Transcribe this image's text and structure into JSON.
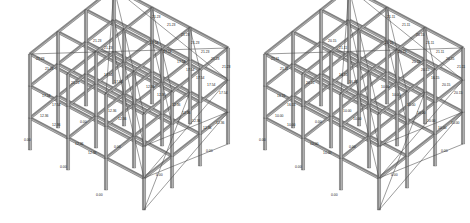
{
  "figure": {
    "type": "structural-frame-elevation-diagram",
    "background_color": "#ffffff",
    "member_color": "#8a8a8a",
    "member_edge_color": "#3a3a3a",
    "brace_color": "#4a4a4a",
    "label_color": "#1a1a1a",
    "panel_count": 2
  },
  "panels": [
    {
      "id": "left-frame",
      "name": "left-structural-frame",
      "storeys": 3,
      "bays_x": 3,
      "bays_y": 3,
      "level_values": [
        "0.00",
        "12.36",
        "17.54",
        "21.23"
      ],
      "labels": [
        {
          "text": "21.23",
          "x": 152,
          "y": 18
        },
        {
          "text": "21.23",
          "x": 167,
          "y": 26
        },
        {
          "text": "21.23",
          "x": 181,
          "y": 36
        },
        {
          "text": "21.23",
          "x": 191,
          "y": 44
        },
        {
          "text": "21.23",
          "x": 201,
          "y": 53
        },
        {
          "text": "21.23",
          "x": 211,
          "y": 60
        },
        {
          "text": "21.23",
          "x": 222,
          "y": 68
        },
        {
          "text": "21.23",
          "x": 93,
          "y": 42
        },
        {
          "text": "21.23",
          "x": 104,
          "y": 49
        },
        {
          "text": "21.23",
          "x": 36,
          "y": 60
        },
        {
          "text": "21.23",
          "x": 45,
          "y": 70
        },
        {
          "text": "21.23",
          "x": 71,
          "y": 84
        },
        {
          "text": "17.54",
          "x": 150,
          "y": 44
        },
        {
          "text": "17.54",
          "x": 163,
          "y": 53
        },
        {
          "text": "17.54",
          "x": 177,
          "y": 63
        },
        {
          "text": "17.54",
          "x": 186,
          "y": 71
        },
        {
          "text": "17.54",
          "x": 196,
          "y": 79
        },
        {
          "text": "17.54",
          "x": 207,
          "y": 86
        },
        {
          "text": "17.54",
          "x": 219,
          "y": 94
        },
        {
          "text": "17.54",
          "x": 104,
          "y": 76
        },
        {
          "text": "17.54",
          "x": 114,
          "y": 83
        },
        {
          "text": "17.54",
          "x": 42,
          "y": 97
        },
        {
          "text": "17.54",
          "x": 52,
          "y": 106
        },
        {
          "text": "12.36",
          "x": 146,
          "y": 88
        },
        {
          "text": "12.36",
          "x": 157,
          "y": 96
        },
        {
          "text": "12.36",
          "x": 172,
          "y": 106
        },
        {
          "text": "12.36",
          "x": 182,
          "y": 114
        },
        {
          "text": "12.36",
          "x": 192,
          "y": 122
        },
        {
          "text": "12.36",
          "x": 203,
          "y": 129
        },
        {
          "text": "12.36",
          "x": 216,
          "y": 124
        },
        {
          "text": "12.36",
          "x": 108,
          "y": 112
        },
        {
          "text": "12.36",
          "x": 118,
          "y": 120
        },
        {
          "text": "12.36",
          "x": 40,
          "y": 117
        },
        {
          "text": "12.36",
          "x": 52,
          "y": 126
        },
        {
          "text": "12.36",
          "x": 75,
          "y": 145
        },
        {
          "text": "12.36",
          "x": 88,
          "y": 154
        },
        {
          "text": "0.00",
          "x": 24,
          "y": 141
        },
        {
          "text": "0.00",
          "x": 60,
          "y": 168
        },
        {
          "text": "0.00",
          "x": 96,
          "y": 196
        },
        {
          "text": "0.00",
          "x": 114,
          "y": 148
        },
        {
          "text": "0.00",
          "x": 156,
          "y": 176
        },
        {
          "text": "0.00",
          "x": 206,
          "y": 152
        },
        {
          "text": "0.00",
          "x": 80,
          "y": 123
        }
      ]
    },
    {
      "id": "right-frame",
      "name": "right-structural-frame",
      "storeys": 3,
      "bays_x": 3,
      "bays_y": 3,
      "level_values": [
        "0.00",
        "10.00",
        "16.15",
        "20.15",
        "21.11"
      ],
      "labels": [
        {
          "text": "21.11",
          "x": 152,
          "y": 18
        },
        {
          "text": "21.11",
          "x": 167,
          "y": 26
        },
        {
          "text": "20.15",
          "x": 181,
          "y": 36
        },
        {
          "text": "21.11",
          "x": 191,
          "y": 44
        },
        {
          "text": "21.11",
          "x": 201,
          "y": 53
        },
        {
          "text": "20.15",
          "x": 211,
          "y": 60
        },
        {
          "text": "21.11",
          "x": 222,
          "y": 68
        },
        {
          "text": "20.15",
          "x": 93,
          "y": 42
        },
        {
          "text": "21.11",
          "x": 104,
          "y": 49
        },
        {
          "text": "21.11",
          "x": 36,
          "y": 60
        },
        {
          "text": "21.11",
          "x": 45,
          "y": 70
        },
        {
          "text": "20.15",
          "x": 71,
          "y": 84
        },
        {
          "text": "20.15",
          "x": 150,
          "y": 44
        },
        {
          "text": "20.15",
          "x": 163,
          "y": 53
        },
        {
          "text": "20.15",
          "x": 177,
          "y": 63
        },
        {
          "text": "20.15",
          "x": 186,
          "y": 71
        },
        {
          "text": "16.15",
          "x": 196,
          "y": 79
        },
        {
          "text": "20.15",
          "x": 207,
          "y": 86
        },
        {
          "text": "20.15",
          "x": 219,
          "y": 94
        },
        {
          "text": "16.15",
          "x": 104,
          "y": 76
        },
        {
          "text": "16.15",
          "x": 114,
          "y": 83
        },
        {
          "text": "16.15",
          "x": 42,
          "y": 97
        },
        {
          "text": "16.15",
          "x": 52,
          "y": 106
        },
        {
          "text": "10.00",
          "x": 146,
          "y": 88
        },
        {
          "text": "10.00",
          "x": 157,
          "y": 96
        },
        {
          "text": "10.00",
          "x": 172,
          "y": 106
        },
        {
          "text": "10.00",
          "x": 182,
          "y": 114
        },
        {
          "text": "10.00",
          "x": 192,
          "y": 122
        },
        {
          "text": "10.00",
          "x": 203,
          "y": 129
        },
        {
          "text": "10.00",
          "x": 216,
          "y": 124
        },
        {
          "text": "10.00",
          "x": 108,
          "y": 112
        },
        {
          "text": "10.00",
          "x": 118,
          "y": 120
        },
        {
          "text": "10.00",
          "x": 40,
          "y": 117
        },
        {
          "text": "10.00",
          "x": 52,
          "y": 126
        },
        {
          "text": "10.00",
          "x": 75,
          "y": 145
        },
        {
          "text": "10.00",
          "x": 88,
          "y": 154
        },
        {
          "text": "0.00",
          "x": 24,
          "y": 141
        },
        {
          "text": "0.00",
          "x": 60,
          "y": 168
        },
        {
          "text": "0.00",
          "x": 96,
          "y": 196
        },
        {
          "text": "0.00",
          "x": 114,
          "y": 148
        },
        {
          "text": "0.00",
          "x": 156,
          "y": 176
        },
        {
          "text": "0.00",
          "x": 206,
          "y": 152
        },
        {
          "text": "0.00",
          "x": 80,
          "y": 123
        }
      ]
    }
  ],
  "geometry": {
    "origin_x": 30,
    "origin_y": 150,
    "bay_dx": 38,
    "bay_dy": 20,
    "depth_dx": 28,
    "depth_dy": -22,
    "storey_h": 32,
    "nx": 3,
    "ny": 3,
    "nz": 3
  }
}
